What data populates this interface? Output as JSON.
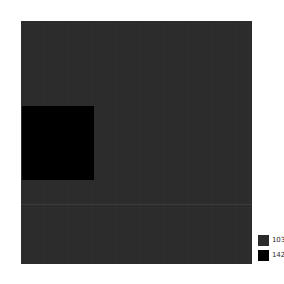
{
  "figure": {
    "background_color": "#ffffff",
    "plot": {
      "name": "label-map",
      "background_color": "#2b2b2b",
      "left": 21,
      "top": 21,
      "width": 231,
      "height": 243
    },
    "regions": [
      {
        "name": "region-142",
        "label": "142",
        "color": "#000000",
        "left": 22,
        "top": 106,
        "width": 72,
        "height": 74
      }
    ]
  },
  "legend": {
    "position": "bottom-right",
    "entries": [
      {
        "label": "103",
        "color": "#2b2b2b"
      },
      {
        "label": "142",
        "color": "#000000"
      }
    ]
  },
  "chart_data": {
    "type": "heatmap",
    "title": "",
    "xlabel": "",
    "ylabel": "",
    "grid": false,
    "legend_position": "bottom-right",
    "categories": [
      "103",
      "142"
    ],
    "values": [
      {
        "label": "103",
        "color": "#2b2b2b",
        "description": "background label region filling the raster"
      },
      {
        "label": "142",
        "color": "#000000",
        "description": "rectangular label region in the left-middle of the raster"
      }
    ],
    "axis_ticks": {
      "x": [],
      "y": []
    },
    "xlim": [
      0,
      231
    ],
    "ylim": [
      0,
      243
    ]
  }
}
